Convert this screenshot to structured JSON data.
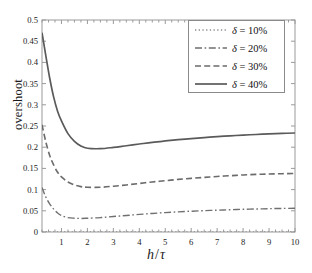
{
  "chart_data": {
    "type": "line",
    "title": "",
    "xlabel": "h/τ",
    "ylabel": "overshoot",
    "xlim": [
      0.25,
      10
    ],
    "ylim": [
      0,
      0.5
    ],
    "grid": false,
    "legend_position": "top-right",
    "xticks": [
      1,
      2,
      3,
      4,
      5,
      6,
      7,
      8,
      9,
      10
    ],
    "xtick_labels": [
      "1",
      "2",
      "3",
      "4",
      "5",
      "6",
      "7",
      "8",
      "9",
      "10"
    ],
    "yticks": [
      0,
      0.05,
      0.1,
      0.15,
      0.2,
      0.25,
      0.3,
      0.35,
      0.4,
      0.45,
      0.5
    ],
    "ytick_labels": [
      "0",
      "0.05",
      "0.1",
      "0.15",
      "0.2",
      "0.25",
      "0.3",
      "0.35",
      "0.4",
      "0.45",
      "0.5"
    ],
    "x": [
      0.25,
      0.4,
      0.55,
      0.7,
      0.85,
      1.0,
      1.25,
      1.5,
      1.75,
      2.0,
      2.5,
      3.0,
      3.5,
      4.0,
      4.5,
      5.0,
      5.5,
      6.0,
      6.5,
      7.0,
      7.5,
      8.0,
      8.5,
      9.0,
      9.5,
      10.0
    ],
    "series": [
      {
        "name": "δ = 10%",
        "delta": "10%",
        "linestyle": "dotted",
        "color": "#8c8c8c",
        "values": [
          0.0,
          0.0,
          0.0,
          0.0,
          0.0,
          0.0,
          0.0,
          0.0,
          0.0,
          0.0,
          0.0,
          0.0,
          0.0,
          0.0,
          0.0,
          0.0,
          0.0,
          0.0,
          0.0,
          0.0,
          0.0,
          0.0,
          0.0,
          0.0,
          0.0,
          0.0
        ]
      },
      {
        "name": "δ = 20%",
        "delta": "20%",
        "linestyle": "dashdot",
        "color": "#707070",
        "values": [
          0.105,
          0.082,
          0.066,
          0.054,
          0.045,
          0.039,
          0.034,
          0.0325,
          0.032,
          0.0325,
          0.034,
          0.0365,
          0.039,
          0.0415,
          0.0438,
          0.0458,
          0.0475,
          0.049,
          0.0503,
          0.0515,
          0.0525,
          0.0535,
          0.0543,
          0.055,
          0.0556,
          0.056
        ]
      },
      {
        "name": "δ = 30%",
        "delta": "30%",
        "linestyle": "dashed",
        "color": "#6b6b6b",
        "values": [
          0.253,
          0.212,
          0.18,
          0.158,
          0.141,
          0.13,
          0.118,
          0.111,
          0.107,
          0.1055,
          0.1055,
          0.108,
          0.111,
          0.1145,
          0.118,
          0.121,
          0.124,
          0.1265,
          0.1288,
          0.131,
          0.1328,
          0.1345,
          0.1358,
          0.1368,
          0.1375,
          0.138
        ]
      },
      {
        "name": "δ = 40%",
        "delta": "40%",
        "linestyle": "solid",
        "color": "#5a5a5a",
        "values": [
          0.47,
          0.415,
          0.362,
          0.318,
          0.285,
          0.262,
          0.232,
          0.214,
          0.203,
          0.1975,
          0.1965,
          0.1995,
          0.2035,
          0.2075,
          0.2115,
          0.2148,
          0.2178,
          0.2203,
          0.2228,
          0.2248,
          0.2268,
          0.2285,
          0.23,
          0.2313,
          0.2325,
          0.2335
        ]
      }
    ]
  },
  "legend": {
    "entries": [
      {
        "label_prefix": "δ",
        "label_rest": " = 10%"
      },
      {
        "label_prefix": "δ",
        "label_rest": " = 20%"
      },
      {
        "label_prefix": "δ",
        "label_rest": " = 30%"
      },
      {
        "label_prefix": "δ",
        "label_rest": " = 40%"
      }
    ]
  },
  "axes": {
    "y_axis_label": "overshoot",
    "x_axis_numerator": "h",
    "x_axis_slash": "/",
    "x_axis_denominator": "τ"
  }
}
